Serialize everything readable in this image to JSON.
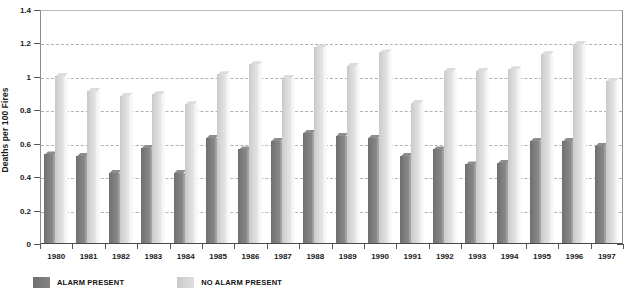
{
  "chart_data": {
    "type": "bar",
    "title": "",
    "xlabel": "",
    "ylabel": "Deaths per 100 Fires",
    "ylim": [
      0,
      1.4
    ],
    "yticks": [
      0,
      0.2,
      0.4,
      0.6,
      0.8,
      1,
      1.2,
      1.4
    ],
    "ytick_labels": [
      "0",
      "0.2",
      "0.4",
      "0.6",
      "0.8",
      "1",
      "1.2",
      "1.4"
    ],
    "grid": "horizontal-dashed",
    "legend_position": "bottom-left",
    "categories": [
      "1980",
      "1981",
      "1982",
      "1983",
      "1984",
      "1985",
      "1986",
      "1987",
      "1988",
      "1989",
      "1990",
      "1991",
      "1992",
      "1993",
      "1994",
      "1995",
      "1996",
      "1997"
    ],
    "series": [
      {
        "name": "ALARM PRESENT",
        "color": "#7c7c7c",
        "values": [
          0.53,
          0.52,
          0.42,
          0.57,
          0.42,
          0.63,
          0.56,
          0.61,
          0.66,
          0.64,
          0.63,
          0.52,
          0.56,
          0.47,
          0.48,
          0.61,
          0.61,
          0.58
        ]
      },
      {
        "name": "NO ALARM PRESENT",
        "color": "#d6d6d6",
        "values": [
          1.0,
          0.91,
          0.88,
          0.89,
          0.83,
          1.01,
          1.07,
          0.99,
          1.17,
          1.06,
          1.14,
          0.84,
          1.03,
          1.03,
          1.04,
          1.13,
          1.19,
          0.97
        ]
      }
    ]
  },
  "legend": {
    "items": [
      {
        "label": "ALARM PRESENT"
      },
      {
        "label": "NO ALARM PRESENT"
      }
    ]
  },
  "colors": {
    "dark_bar": "#7c7c7c",
    "light_bar": "#d6d6d6",
    "gridline": "#b2b2b2",
    "axis": "#4a4a4a",
    "text": "#1a1a1a"
  }
}
